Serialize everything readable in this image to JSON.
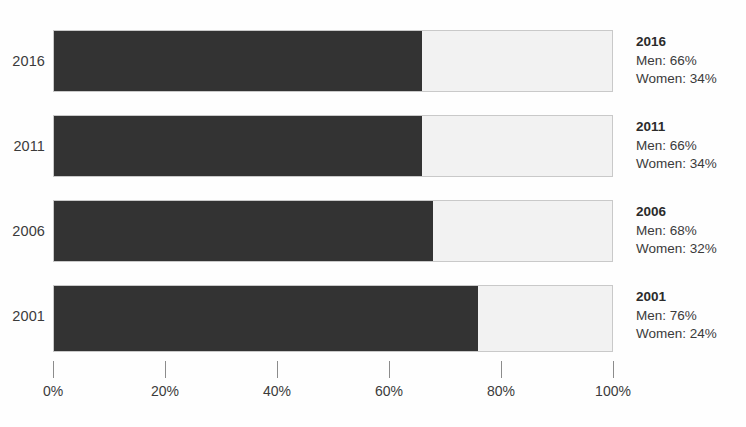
{
  "chart_data": {
    "type": "bar",
    "orientation": "horizontal",
    "stacked": true,
    "stack_mode": "percent",
    "title": "",
    "subtitle": "",
    "xlabel": "",
    "ylabel": "",
    "xlim": [
      0,
      100
    ],
    "grid": false,
    "legend": "none",
    "annotations_position": "right-of-bars",
    "categories": [
      "2016",
      "2011",
      "2006",
      "2001"
    ],
    "tick_values": [
      0,
      20,
      40,
      60,
      80,
      100
    ],
    "tick_labels": [
      "0%",
      "20%",
      "40%",
      "60%",
      "80%",
      "100%"
    ],
    "series": [
      {
        "name": "Men",
        "color": "#333333",
        "values": [
          66,
          66,
          68,
          76
        ]
      },
      {
        "name": "Women",
        "color": "#f2f2f2",
        "values": [
          34,
          34,
          32,
          24
        ]
      }
    ],
    "bars": [
      {
        "category": "2016",
        "men": 66,
        "women": 34,
        "men_label": "Men: 66%",
        "women_label": "Women: 34%"
      },
      {
        "category": "2011",
        "men": 66,
        "women": 34,
        "men_label": "Men: 66%",
        "women_label": "Women: 34%"
      },
      {
        "category": "2006",
        "men": 68,
        "women": 32,
        "men_label": "Men: 68%",
        "women_label": "Women: 32%"
      },
      {
        "category": "2001",
        "men": 76,
        "women": 24,
        "men_label": "Men: 76%",
        "women_label": "Women: 24%"
      }
    ],
    "colors": {
      "men": "#333333",
      "women": "#f2f2f2",
      "bar_border": "#c9c9c9",
      "text": "#3b3b3b",
      "tick": "#8c8c8c",
      "background": "#fefefe"
    }
  }
}
